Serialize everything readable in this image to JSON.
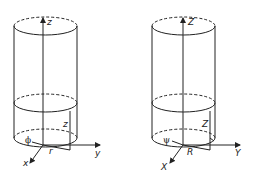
{
  "figure": {
    "left_panel": {
      "name": "cylinder-lowercase-coordinates",
      "labels": {
        "z_axis": "z",
        "z_height": "z",
        "y_axis": "y",
        "x_axis": "x",
        "radius": "r",
        "angle": "ϕ"
      }
    },
    "right_panel": {
      "name": "cylinder-uppercase-coordinates",
      "labels": {
        "z_axis": "Z",
        "z_height": "Z",
        "y_axis": "Y",
        "x_axis": "X",
        "radius": "R",
        "angle": "ψ"
      }
    },
    "colors": {
      "line": "#222222",
      "background": "#ffffff"
    }
  }
}
